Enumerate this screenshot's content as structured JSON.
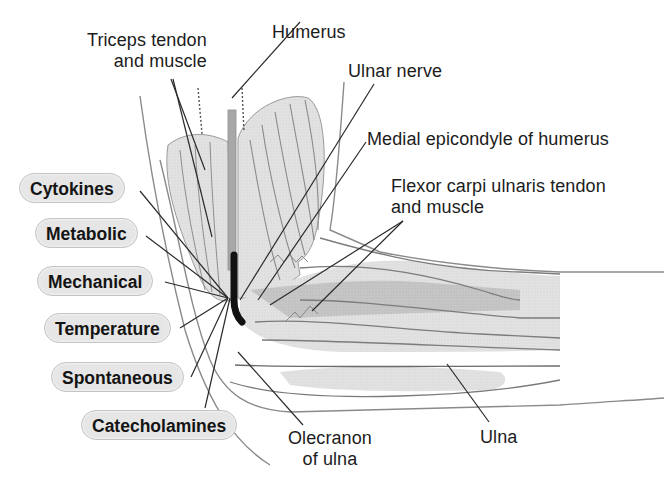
{
  "figure": {
    "colors": {
      "background": "#ffffff",
      "pill_fill": "#e6e6e6",
      "pill_border": "#c4c4c4",
      "leader_line": "#2a2a2a",
      "muscle_light": "#e4e4e4",
      "muscle_mid": "#cfcfcf",
      "muscle_dark": "#b5b5b5",
      "nerve": "#111111",
      "humerus": "#a8a8a8"
    }
  },
  "anatomy_labels": {
    "triceps": {
      "line1": "Triceps tendon",
      "line2": "and muscle"
    },
    "humerus": "Humerus",
    "ulnar_nerve": "Ulnar nerve",
    "medial_epicondyle": "Medial epicondyle of humerus",
    "flexor": {
      "line1": "Flexor carpi ulnaris tendon",
      "line2": "and muscle"
    },
    "olecranon": {
      "line1": "Olecranon",
      "line2": "of ulna"
    },
    "ulna": "Ulna"
  },
  "factor_labels": [
    {
      "id": "cytokines",
      "label": "Cytokines"
    },
    {
      "id": "metabolic",
      "label": "Metabolic"
    },
    {
      "id": "mechanical",
      "label": "Mechanical"
    },
    {
      "id": "temperature",
      "label": "Temperature"
    },
    {
      "id": "spontaneous",
      "label": "Spontaneous"
    },
    {
      "id": "catecholamines",
      "label": "Catecholamines"
    }
  ]
}
